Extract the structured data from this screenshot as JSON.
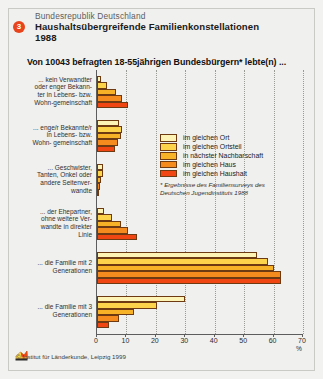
{
  "header": {
    "badge": "3",
    "country": "Bundesrepublik Deutschland",
    "title": "Haushaltsübergreifende Familienkonstellationen",
    "year": "1988"
  },
  "question": "Von 10043 befragten 18-55jährigen Bundesbürgern* lebte(n) ...",
  "footnote": "* Ergebnisse des Familiensurveys des Deutschen Jugendinstituts 1988",
  "footer": "© Institut für Länderkunde, Leipzig 1999",
  "axis_unit": "%",
  "colors": {
    "series": [
      "#fdf3b4",
      "#fcd34a",
      "#f8b227",
      "#f58a1f",
      "#ef4612"
    ],
    "badge": "#e8431a",
    "outline": "#6e3a12",
    "background": "#f0f0ee"
  },
  "chart_data": {
    "type": "bar",
    "title": "Haushaltsübergreifende Familienkonstellationen 1988",
    "subtitle": "Von 10043 befragten 18-55jährigen Bundesbürgern* lebte(n) ...",
    "orientation": "horizontal",
    "grouped": true,
    "xlabel": "%",
    "ylabel": "",
    "xlim": [
      0,
      70
    ],
    "xticks": [
      "0",
      "10",
      "20",
      "30",
      "40",
      "50",
      "60",
      "70"
    ],
    "grid": true,
    "legend_position": "inside-right",
    "categories": [
      "... kein Verwandter oder enger Bekannter in Lebens- bzw. Wohn-gemeinschaft",
      "... enge/r Bekannte/r in Lebens- bzw. Wohn- gemeinschaft",
      "... Geschwister, Tanten, Onkel oder andere Seitenverwandte",
      "... der Ehepartner, ohne weitere Verwandte in direkter Linie",
      "... die Familie mit 2 Generationen",
      "... die Familie mit 3 Generationen"
    ],
    "category_lines": [
      [
        "... kein Verwandter",
        "oder enger Bekann-",
        "ter in Lebens- bzw.",
        "Wohn-gemeinschaft"
      ],
      [
        "... enge/r Bekannte/r",
        "in Lebens- bzw.",
        "Wohn- gemeinschaft"
      ],
      [
        "... Geschwister,",
        "Tanten, Onkel oder",
        "andere Seitenver-",
        "wandte"
      ],
      [
        "... der Ehepartner,",
        "ohne weitere Ver-",
        "wandte in direkter",
        "Linie"
      ],
      [
        "... die Familie mit 2",
        "Generationen"
      ],
      [
        "... die Familie mit 3",
        "Generationen"
      ]
    ],
    "series": [
      {
        "name": "im gleichen Ort",
        "values": [
          1.5,
          7.5,
          2.0,
          2.5,
          54.5,
          30.0
        ]
      },
      {
        "name": "im gleichen Ortsteil",
        "values": [
          3.5,
          8.5,
          2.0,
          5.0,
          58.0,
          20.5
        ]
      },
      {
        "name": "in nächster Nachbarschaft",
        "values": [
          6.5,
          8.0,
          1.5,
          8.0,
          60.0,
          12.5
        ]
      },
      {
        "name": "im gleichen Haus",
        "values": [
          8.5,
          7.0,
          1.0,
          10.5,
          62.5,
          7.5
        ]
      },
      {
        "name": "im gleichen Haushalt",
        "values": [
          10.5,
          6.0,
          0.5,
          13.5,
          62.5,
          4.0
        ]
      }
    ]
  }
}
